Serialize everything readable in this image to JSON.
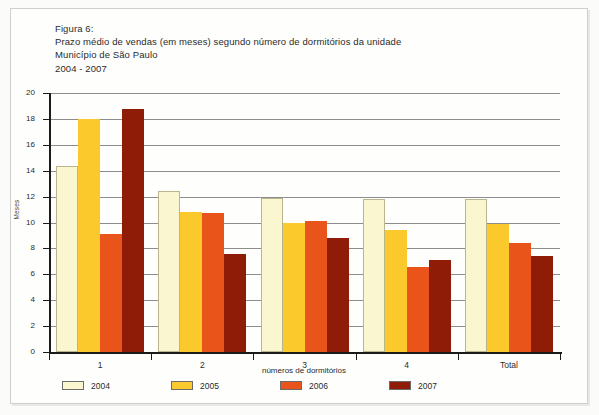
{
  "title": {
    "line1": "Figura 6:",
    "line2": "Prazo médio de vendas (em meses) segundo número de dormitórios da unidade",
    "line3": "Município de São Paulo",
    "line4": "2004 - 2007"
  },
  "chart_data": {
    "type": "bar",
    "title": "Prazo médio de vendas (em meses) segundo número de dormitórios da unidade",
    "subtitle": "Município de São Paulo 2004 - 2007",
    "figure_number": "Figura 6:",
    "period": "2004 - 2007",
    "xlabel": "números de dormitórios",
    "ylabel": "Meses",
    "categories": [
      "1",
      "2",
      "3",
      "4",
      "Total"
    ],
    "ylim": [
      0,
      20
    ],
    "yticks": [
      0,
      2,
      4,
      6,
      8,
      10,
      12,
      14,
      16,
      18,
      20
    ],
    "ytick_labels": [
      "0",
      "2",
      "4",
      "6",
      "8",
      "10",
      "12",
      "14",
      "16",
      "18",
      "20"
    ],
    "grid": true,
    "legend_position": "bottom-left",
    "series": [
      {
        "name": "2004",
        "color": "#faf6d0",
        "values": [
          14.4,
          12.4,
          11.9,
          11.8,
          11.8
        ]
      },
      {
        "name": "2005",
        "color": "#fbc92b",
        "values": [
          18.0,
          10.8,
          10.0,
          9.4,
          9.9
        ]
      },
      {
        "name": "2006",
        "color": "#e8541a",
        "values": [
          9.1,
          10.7,
          10.1,
          6.6,
          8.4
        ]
      },
      {
        "name": "2007",
        "color": "#8e1c06",
        "values": [
          18.8,
          7.6,
          8.8,
          7.1,
          7.4
        ]
      }
    ]
  }
}
